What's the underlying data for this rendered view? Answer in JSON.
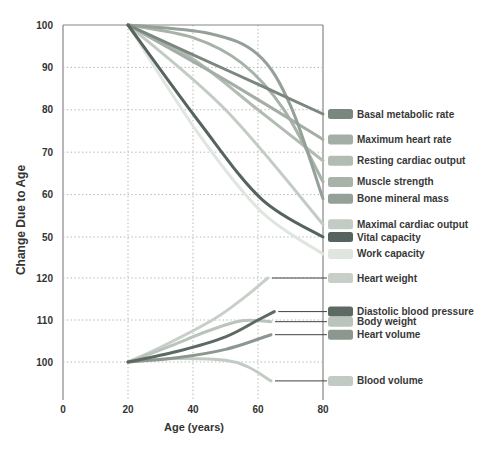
{
  "chart_data": {
    "type": "line",
    "xlabel": "Age (years)",
    "ylabel": "Change Due to Age",
    "x_ticks": [
      0,
      20,
      40,
      60,
      80
    ],
    "x_range": [
      0,
      80
    ],
    "grid": "dotted",
    "legend_position": "right",
    "panels": [
      {
        "name": "declining-functions",
        "y_ticks": [
          100,
          90,
          80,
          70,
          60,
          50
        ],
        "y_range": [
          46,
          100
        ],
        "callouts": false,
        "series": [
          {
            "name": "Basal metabolic rate",
            "color": "#7a877f",
            "points": [
              [
                20,
                100
              ],
              [
                50,
                89.5
              ],
              [
                80,
                79
              ]
            ]
          },
          {
            "name": "Maximum heart rate",
            "color": "#a4aea6",
            "points": [
              [
                20,
                100
              ],
              [
                50,
                87
              ],
              [
                80,
                73
              ]
            ]
          },
          {
            "name": "Resting cardiac output",
            "color": "#b2bcb3",
            "points": [
              [
                20,
                100
              ],
              [
                40,
                92
              ],
              [
                60,
                80
              ],
              [
                80,
                68
              ]
            ]
          },
          {
            "name": "Muscle strength",
            "color": "#a8b2a9",
            "points": [
              [
                20,
                100
              ],
              [
                40,
                97
              ],
              [
                55,
                91
              ],
              [
                68,
                80
              ],
              [
                80,
                63
              ]
            ]
          },
          {
            "name": "Bone mineral mass",
            "color": "#95a098",
            "points": [
              [
                20,
                100
              ],
              [
                45,
                98
              ],
              [
                60,
                93
              ],
              [
                70,
                81
              ],
              [
                80,
                59
              ]
            ]
          },
          {
            "name": "Maximal cardiac output",
            "color": "#c3ccc4",
            "points": [
              [
                20,
                100
              ],
              [
                50,
                80
              ],
              [
                80,
                53
              ]
            ]
          },
          {
            "name": "Vital capacity",
            "color": "#57635f",
            "points": [
              [
                20,
                100
              ],
              [
                42,
                77
              ],
              [
                61,
                59
              ],
              [
                80,
                50
              ]
            ]
          },
          {
            "name": "Work capacity",
            "color": "#dfe5df",
            "points": [
              [
                20,
                100
              ],
              [
                42,
                74
              ],
              [
                61,
                56
              ],
              [
                80,
                46
              ]
            ]
          }
        ]
      },
      {
        "name": "increasing-functions",
        "y_ticks": [
          120,
          110,
          100
        ],
        "y_range": [
          95,
          121
        ],
        "callouts": true,
        "series": [
          {
            "name": "Heart weight",
            "color": "#c7cfc8",
            "points": [
              [
                20,
                100
              ],
              [
                30,
                103.5
              ],
              [
                46,
                110
              ],
              [
                56,
                115.5
              ],
              [
                63,
                120
              ]
            ]
          },
          {
            "name": "Diastolic blood pressure",
            "color": "#5d6a64",
            "points": [
              [
                20,
                100
              ],
              [
                35,
                102.5
              ],
              [
                50,
                106
              ],
              [
                60,
                110
              ],
              [
                65,
                112
              ]
            ]
          },
          {
            "name": "Body weight",
            "color": "#bac4bb",
            "points": [
              [
                20,
                100
              ],
              [
                32,
                103.5
              ],
              [
                45,
                107.5
              ],
              [
                55,
                109.8
              ],
              [
                64,
                109.6
              ]
            ]
          },
          {
            "name": "Heart volume",
            "color": "#8b978f",
            "points": [
              [
                20,
                100
              ],
              [
                35,
                101
              ],
              [
                50,
                103
              ],
              [
                64,
                106.5
              ]
            ]
          },
          {
            "name": "Blood volume",
            "color": "#c2cbc3",
            "points": [
              [
                20,
                100
              ],
              [
                35,
                100.8
              ],
              [
                50,
                100.4
              ],
              [
                57,
                98.8
              ],
              [
                64,
                95.5
              ]
            ]
          }
        ]
      }
    ],
    "colors": {
      "text": "#333333",
      "grid": "#b5b5b5",
      "axis": "#868686",
      "callout": "#404040",
      "background": "#ffffff"
    }
  }
}
